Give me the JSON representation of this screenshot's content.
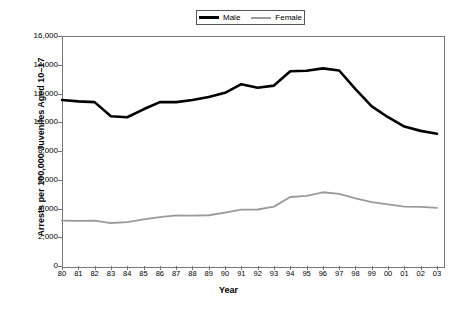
{
  "chart_data": {
    "type": "line",
    "title": "",
    "xlabel": "Year",
    "ylabel": "Arrests per 100,000 Juveniles Aged 10–17",
    "categories": [
      "80",
      "81",
      "82",
      "83",
      "84",
      "85",
      "86",
      "87",
      "88",
      "89",
      "90",
      "91",
      "92",
      "93",
      "94",
      "95",
      "96",
      "97",
      "98",
      "99",
      "00",
      "01",
      "02",
      "03"
    ],
    "ylim": [
      0,
      16000
    ],
    "yticks": [
      "0",
      "2,000",
      "4,000",
      "6,000",
      "8,000",
      "10,000",
      "12,000",
      "14,000",
      "16,000"
    ],
    "ytick_values": [
      0,
      2000,
      4000,
      6000,
      8000,
      10000,
      12000,
      14000,
      16000
    ],
    "grid": false,
    "legend_position": "top-center",
    "series": [
      {
        "name": "Male",
        "color": "#000000",
        "values": [
          11550,
          11450,
          11400,
          10420,
          10350,
          10900,
          11400,
          11400,
          11550,
          11750,
          12050,
          12650,
          12400,
          12550,
          13550,
          13580,
          13750,
          13600,
          12300,
          11100,
          10350,
          9700,
          9400,
          9200
        ]
      },
      {
        "name": "Female",
        "color": "#9a9a9a",
        "values": [
          3150,
          3140,
          3160,
          2990,
          3050,
          3250,
          3400,
          3520,
          3500,
          3530,
          3720,
          3920,
          3930,
          4130,
          4800,
          4880,
          5130,
          5020,
          4700,
          4450,
          4280,
          4130,
          4120,
          4050
        ]
      }
    ]
  },
  "legend": {
    "entries": [
      {
        "label": "Male"
      },
      {
        "label": "Female"
      }
    ]
  },
  "axes": {
    "x_title": "Year",
    "y_title": "Arrests per 100,000 Juveniles Aged 10–17"
  }
}
